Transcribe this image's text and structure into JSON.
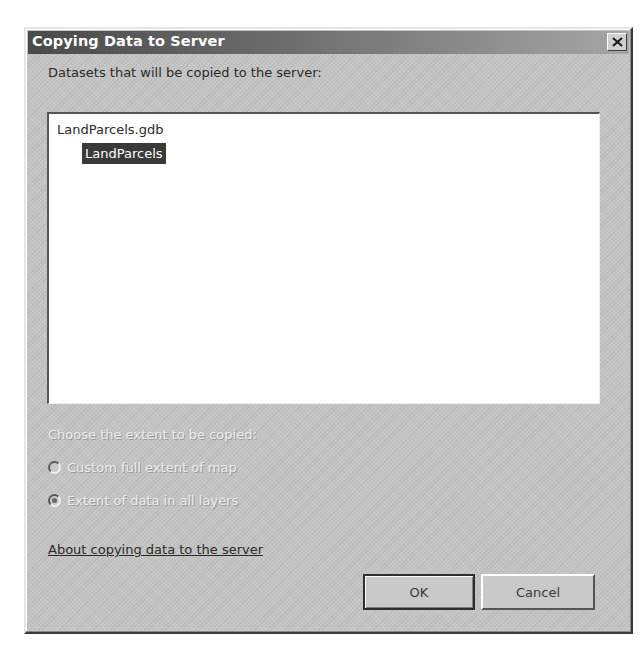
{
  "dialog": {
    "title": "Copying Data to Server",
    "close_icon": "close-icon"
  },
  "datasets": {
    "label": "Datasets that will be copied to the server:",
    "items": [
      {
        "label": "LandParcels.gdb",
        "level": 0,
        "selected": false
      },
      {
        "label": "LandParcels",
        "level": 1,
        "selected": true
      }
    ]
  },
  "extent": {
    "label": "Choose the extent to be copied:",
    "enabled": false,
    "options": [
      {
        "label": "Custom full extent of map",
        "checked": false
      },
      {
        "label": "Extent of data in all layers",
        "checked": true
      }
    ]
  },
  "help_link": {
    "label": "About copying data to the server"
  },
  "buttons": {
    "ok_label": "OK",
    "cancel_label": "Cancel"
  },
  "colors": {
    "title_bar_start": "#4a4a4a",
    "title_bar_end": "#a6a6a6",
    "dialog_bg": "#c4c4c4",
    "selection_bg": "#3a3a3a",
    "disabled_text": "#ececec"
  }
}
